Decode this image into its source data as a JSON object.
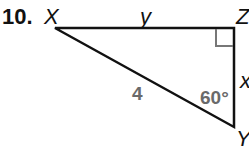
{
  "problem": {
    "number": "10.",
    "vertices": {
      "X": "X",
      "Y": "Y",
      "Z": "Z"
    },
    "sides": {
      "top": "y",
      "right": "x",
      "hypotenuse": "4"
    },
    "angle_Y": "60°",
    "right_angle_at": "Z"
  }
}
